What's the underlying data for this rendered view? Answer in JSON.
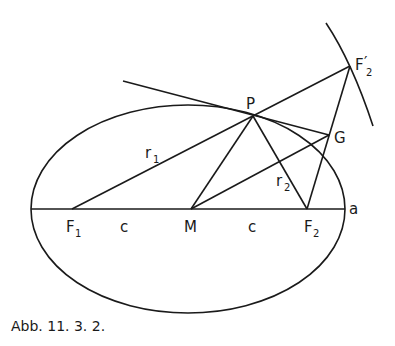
{
  "figure": {
    "caption": "Abb. 11. 3. 2.",
    "labels": {
      "P": "P",
      "G": "G",
      "F1": "F",
      "F1_sub": "1",
      "F2": "F",
      "F2_sub": "2",
      "F2p": "F",
      "F2p_sub": "2",
      "F2p_prime": "′",
      "M": "M",
      "a": "a",
      "c_left": "c",
      "c_right": "c",
      "r1": "r",
      "r1_sub": "1",
      "r2": "r",
      "r2_sub": "2"
    }
  }
}
